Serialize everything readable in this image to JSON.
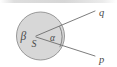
{
  "figure": {
    "type": "geometry-diagram",
    "title": "",
    "background_color": "#ffffff",
    "top_bar_color": "#cfcfcf",
    "circle": {
      "name": "shaded-disk",
      "center_x": 40.5,
      "center_y": 36,
      "radius": 24,
      "fill_color": "#d6d6d6",
      "stroke_color": "#8c8c8c"
    },
    "vertex": {
      "name": "S",
      "label": "S",
      "x": 36,
      "y": 38.5
    },
    "labels": {
      "beta": "β",
      "alpha": "α",
      "s": "S",
      "q": "q",
      "p": "p"
    },
    "label_positions": {
      "beta": {
        "x": 23,
        "y": 37
      },
      "alpha": {
        "x": 53,
        "y": 38
      },
      "s": {
        "x": 34,
        "y": 45
      },
      "q": {
        "x": 101,
        "y": 16
      },
      "p": {
        "x": 101,
        "y": 61
      }
    },
    "rays": [
      {
        "name": "ray-q",
        "label": "q",
        "from_x": 36,
        "from_y": 36,
        "to_x": 96,
        "to_y": 11,
        "stroke_color": "#6e6e6e"
      },
      {
        "name": "ray-p",
        "label": "p",
        "from_x": 36,
        "from_y": 37,
        "to_x": 96,
        "to_y": 56,
        "stroke_color": "#6e6e6e"
      }
    ],
    "angle_arc": {
      "name": "alpha-angle-arc",
      "label": "α",
      "stroke_color": "#6e6e6e"
    },
    "stroke_color": "#6e6e6e",
    "text_color": "#4a4a4a"
  }
}
